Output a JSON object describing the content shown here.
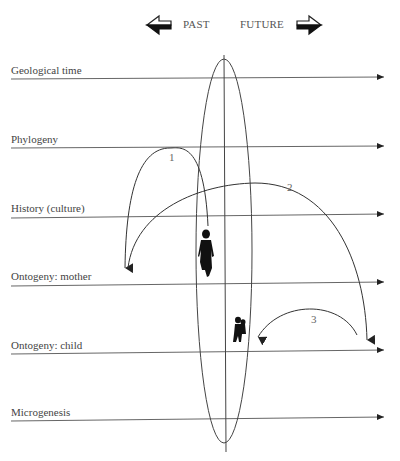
{
  "header": {
    "past_label": "PAST",
    "future_label": "FUTURE",
    "past_icon": "arrow-left-icon",
    "future_icon": "arrow-right-icon"
  },
  "levels": [
    {
      "label": "Geological time",
      "y": 78
    },
    {
      "label": "Phylogeny",
      "y": 147
    },
    {
      "label": "History (culture)",
      "y": 215
    },
    {
      "label": "Ontogeny: mother",
      "y": 283
    },
    {
      "label": "Ontogeny: child",
      "y": 351
    },
    {
      "label": "Microgenesis",
      "y": 418
    }
  ],
  "arcs": [
    {
      "number": "1",
      "from": "Ontogeny: mother figure",
      "to": "History (culture) / Ontogeny: mother (past)"
    },
    {
      "number": "2",
      "from": "History (culture) (past)",
      "to": "Ontogeny: child (future)"
    },
    {
      "number": "3",
      "from": "Ontogeny: child (future)",
      "to": "Ontogeny: child figure"
    }
  ],
  "figures": [
    {
      "name": "mother-figure"
    },
    {
      "name": "child-figure"
    }
  ],
  "colors": {
    "line": "#444444",
    "text": "#444444",
    "figure": "#111111"
  }
}
